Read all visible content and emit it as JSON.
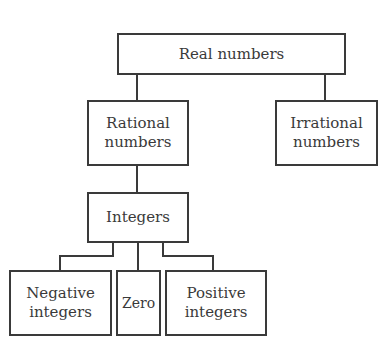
{
  "diagram": {
    "type": "hierarchy",
    "nodes": {
      "real": {
        "label": "Real numbers"
      },
      "rational": {
        "label": "Rational\nnumbers"
      },
      "irrational": {
        "label": "Irrational\nnumbers"
      },
      "integers": {
        "label": "Integers"
      },
      "negative": {
        "label": "Negative\nintegers"
      },
      "zero": {
        "label": "Zero"
      },
      "positive": {
        "label": "Positive\nintegers"
      }
    },
    "edges": [
      [
        "real",
        "rational"
      ],
      [
        "real",
        "irrational"
      ],
      [
        "rational",
        "integers"
      ],
      [
        "integers",
        "negative"
      ],
      [
        "integers",
        "zero"
      ],
      [
        "integers",
        "positive"
      ]
    ],
    "colors": {
      "line": "#3a3a3a",
      "background": "#ffffff"
    }
  }
}
